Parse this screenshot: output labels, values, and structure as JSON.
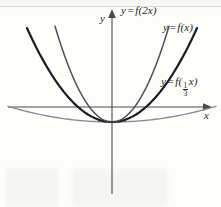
{
  "figure": {
    "axis_labels": {
      "x": "x",
      "y": "y"
    },
    "labels": {
      "f2x": {
        "lhs": "y",
        "eq": "=",
        "rhs": "f(2x)"
      },
      "fx": {
        "lhs": "y",
        "eq": "=",
        "rhs": "f(x)"
      },
      "f13x": {
        "lhs": "y",
        "eq": "=",
        "rhs_open": "f(",
        "num": "1",
        "den": "3",
        "rhs_close": "x)"
      }
    },
    "colors": {
      "axis": "#4a4a4a",
      "curve_fx": "#1c1c1c",
      "curve_f2x": "#4e4e4e",
      "curve_f13x": "#8d8d8d",
      "paper": "#fdfdfb"
    }
  },
  "chart_data": {
    "type": "line",
    "title": "",
    "xlabel": "x",
    "ylabel": "y",
    "grid": false,
    "legend": "inline-curve-labels",
    "axes": {
      "x_axis_pixel_y": 107,
      "y_axis_pixel_x": 112,
      "x_arrow_pixel_x": 205,
      "y_arrow_pixel_y": 15,
      "vertex_pixel": [
        112,
        122
      ]
    },
    "series": [
      {
        "name": "y = f(2x)",
        "color": "#4e4e4e",
        "width": 1.5,
        "scale": 2,
        "a_pixel": 0.0295,
        "x_pixel_range": [
          55,
          169
        ],
        "points": [
          [
            55,
            12
          ],
          [
            62,
            25
          ],
          [
            70,
            41
          ],
          [
            78,
            57
          ],
          [
            86,
            72
          ],
          [
            94,
            86
          ],
          [
            102,
            102
          ],
          [
            112,
            122
          ],
          [
            122,
            102
          ],
          [
            130,
            86
          ],
          [
            138,
            72
          ],
          [
            146,
            57
          ],
          [
            154,
            41
          ],
          [
            162,
            25
          ],
          [
            169,
            12
          ]
        ]
      },
      {
        "name": "y = f(x)",
        "color": "#1c1c1c",
        "width": 2.2,
        "scale": 1,
        "a_pixel": 0.013,
        "x_pixel_range": [
          27,
          197
        ],
        "points": [
          [
            27,
            12
          ],
          [
            40,
            40
          ],
          [
            52,
            62
          ],
          [
            64,
            81
          ],
          [
            76,
            96
          ],
          [
            88,
            108
          ],
          [
            100,
            117
          ],
          [
            112,
            122
          ],
          [
            124,
            117
          ],
          [
            136,
            108
          ],
          [
            148,
            96
          ],
          [
            160,
            81
          ],
          [
            172,
            62
          ],
          [
            184,
            40
          ],
          [
            197,
            12
          ]
        ]
      },
      {
        "name": "y = f((1/3)x)",
        "color": "#8d8d8d",
        "width": 1.4,
        "scale": 0.3333,
        "a_pixel": 0.00145,
        "x_pixel_range": [
          8,
          216
        ],
        "x_intercepts_pixel": [
          22,
          188
        ],
        "points": [
          [
            8,
            93
          ],
          [
            24,
            106
          ],
          [
            40,
            115
          ],
          [
            56,
            119
          ],
          [
            72,
            121
          ],
          [
            88,
            122
          ],
          [
            112,
            122
          ],
          [
            136,
            122
          ],
          [
            152,
            121
          ],
          [
            168,
            119
          ],
          [
            184,
            115
          ],
          [
            200,
            106
          ],
          [
            216,
            93
          ]
        ]
      }
    ]
  }
}
